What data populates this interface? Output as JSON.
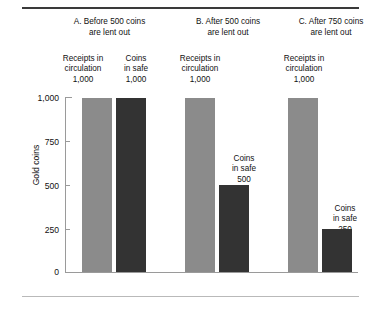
{
  "chart_data": {
    "type": "bar",
    "title": "",
    "xlabel": "",
    "ylabel": "Gold coins",
    "ylim": [
      0,
      1000
    ],
    "yticks": [
      "0",
      "250",
      "500",
      "750",
      "1,000"
    ],
    "grid": false,
    "legend": "none",
    "panels": [
      {
        "id": "A",
        "title_line1": "A. Before 500 coins",
        "title_line2": "are lent out",
        "bars": [
          {
            "label_line1": "Receipts in",
            "label_line2": "circulation",
            "value_label": "1,000",
            "value": 1000,
            "color": "#8b8b8b"
          },
          {
            "label_line1": "Coins",
            "label_line2": "in safe",
            "value_label": "1,000",
            "value": 1000,
            "color": "#333333"
          }
        ]
      },
      {
        "id": "B",
        "title_line1": "B. After 500 coins",
        "title_line2": "are lent out",
        "bars": [
          {
            "label_line1": "Receipts in",
            "label_line2": "circulation",
            "value_label": "1,000",
            "value": 1000,
            "color": "#8b8b8b"
          },
          {
            "label_line1": "Coins",
            "label_line2": "in safe",
            "value_label": "500",
            "value": 500,
            "color": "#333333"
          }
        ]
      },
      {
        "id": "C",
        "title_line1": "C. After 750 coins",
        "title_line2": "are lent out",
        "bars": [
          {
            "label_line1": "Receipts in",
            "label_line2": "circulation",
            "value_label": "1,000",
            "value": 1000,
            "color": "#8b8b8b"
          },
          {
            "label_line1": "Coins",
            "label_line2": "in safe",
            "value_label": "250",
            "value": 250,
            "color": "#333333"
          }
        ]
      }
    ]
  }
}
